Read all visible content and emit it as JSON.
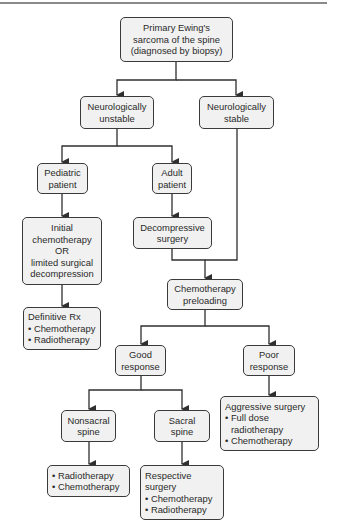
{
  "diagram": {
    "type": "flowchart",
    "nodes": {
      "primary": [
        "Primary Ewing's",
        "sarcoma of the spine",
        "(diagnosed by biopsy)"
      ],
      "neuro_unstable": [
        "Neurologically",
        "unstable"
      ],
      "neuro_stable": [
        "Neurologically",
        "stable"
      ],
      "pediatric": [
        "Pediatric",
        "patient"
      ],
      "adult": [
        "Adult",
        "patient"
      ],
      "initial_chemo": [
        "Initial",
        "chemotherapy",
        "OR",
        "limited surgical",
        "decompression"
      ],
      "decompressive": [
        "Decompressive",
        "surgery"
      ],
      "definitive_rx": [
        "Definitive Rx",
        "• Chemotherapy",
        "• Radiotherapy"
      ],
      "chemo_preloading": [
        "Chemotherapy",
        "preloading"
      ],
      "good_response": [
        "Good",
        "response"
      ],
      "poor_response": [
        "Poor",
        "response"
      ],
      "aggressive": [
        "Aggressive surgery",
        "• Full dose",
        "radiotherapy",
        "• Chemotherapy"
      ],
      "nonsacral": [
        "Nonsacral",
        "spine"
      ],
      "sacral": [
        "Sacral",
        "spine"
      ],
      "nonsacral_tx": [
        "• Radiotherapy",
        "• Chemotherapy"
      ],
      "sacral_tx": [
        "Respective",
        "surgery",
        "• Chemotherapy",
        "• Radiotherapy"
      ]
    },
    "edges": [
      [
        "primary",
        "neuro_unstable"
      ],
      [
        "primary",
        "neuro_stable"
      ],
      [
        "neuro_unstable",
        "pediatric"
      ],
      [
        "neuro_unstable",
        "adult"
      ],
      [
        "pediatric",
        "initial_chemo"
      ],
      [
        "adult",
        "decompressive"
      ],
      [
        "initial_chemo",
        "definitive_rx"
      ],
      [
        "decompressive",
        "chemo_preloading"
      ],
      [
        "neuro_stable",
        "chemo_preloading"
      ],
      [
        "chemo_preloading",
        "good_response"
      ],
      [
        "chemo_preloading",
        "poor_response"
      ],
      [
        "good_response",
        "nonsacral"
      ],
      [
        "good_response",
        "sacral"
      ],
      [
        "poor_response",
        "aggressive"
      ],
      [
        "nonsacral",
        "nonsacral_tx"
      ],
      [
        "sacral",
        "sacral_tx"
      ]
    ],
    "colors": {
      "line": "#2f2f2f",
      "box_fill": "#f1f1f1",
      "box_border": "#3a3a3a"
    }
  }
}
